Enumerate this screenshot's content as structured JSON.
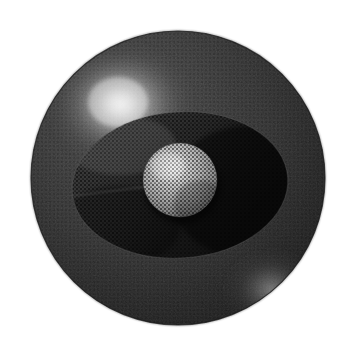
{
  "canvas": {
    "width": 358,
    "height": 348,
    "background_color": "#ffffff",
    "title": "Shaded sphere with halftone ellipse and central disc"
  },
  "palette": {
    "background": "#ffffff",
    "sphere_base": "#333333",
    "sphere_dark": "#1b1b1b",
    "sphere_edge": "#2a2a2a",
    "highlight_core": "#f2f2f2",
    "highlight_mid": "#9a9a9a",
    "rim_glow": "#b4b4b4",
    "ellipse_band": "#242424",
    "ellipse_dark": "#121212",
    "disc_core": "#d8d8d8",
    "disc_mid": "#9c9c9c",
    "disc_edge": "#5a5a5a",
    "halftone_dot": "#050505"
  },
  "shapes": {
    "sphere": {
      "label": "outer-sphere",
      "center_x": 178,
      "center_y": 178,
      "radius": 147,
      "fill": "#2e2e2e"
    },
    "specular_highlight": {
      "label": "upper-left-specular-highlight",
      "center_x": 120,
      "center_y": 104,
      "radius_x": 78,
      "radius_y": 66,
      "peak_color": "#f0f0f0"
    },
    "rim_highlight": {
      "label": "lower-right-rim-highlight",
      "center_x": 272,
      "center_y": 290,
      "radius_x": 52,
      "radius_y": 44,
      "peak_color": "#aeaeae"
    },
    "ellipse_band": {
      "label": "halftone-ellipse-band",
      "center_x": 180,
      "center_y": 185,
      "radius_x": 108,
      "radius_y": 73,
      "rotation_deg": -4,
      "fill": "#202020"
    },
    "center_disc": {
      "label": "central-bright-disc",
      "center_x": 180,
      "center_y": 180,
      "radius": 37,
      "fill": "#c9c9c9"
    }
  },
  "texture": {
    "halftone_spacing": 4,
    "halftone_dot_radius": 0.95,
    "halftone_color": "#060606",
    "noise_opacity": 0.16
  },
  "labels": {
    "alt_text": "Dark shaded sphere with a bright specular highlight at the upper left, a halftone-textured ellipse band across the middle, and a bright circular disc at the center."
  }
}
